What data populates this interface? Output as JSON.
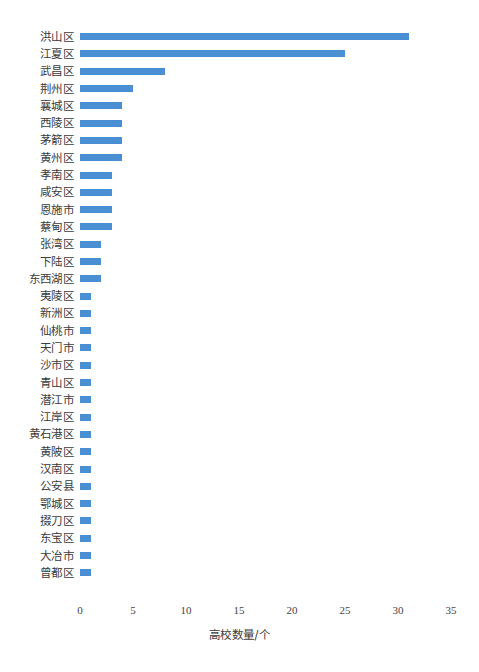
{
  "chart_data": {
    "type": "bar",
    "orientation": "horizontal",
    "title": "",
    "xlabel": "高校数量/个",
    "ylabel": "",
    "xlim": [
      0,
      35
    ],
    "xticks": [
      0,
      5,
      10,
      15,
      20,
      25,
      30,
      35
    ],
    "xtick_labels": [
      "0",
      "5",
      "10",
      "15",
      "20",
      "25",
      "30",
      "35"
    ],
    "grid": false,
    "legend": null,
    "series_color": "#4a8fd4",
    "categories": [
      "洪山区",
      "江夏区",
      "武昌区",
      "荆州区",
      "襄城区",
      "西陵区",
      "茅箭区",
      "黄州区",
      "孝南区",
      "咸安区",
      "恩施市",
      "蔡甸区",
      "张湾区",
      "下陆区",
      "东西湖区",
      "夷陵区",
      "新洲区",
      "仙桃市",
      "天门市",
      "沙市区",
      "青山区",
      "潜江市",
      "江岸区",
      "黄石港区",
      "黄陂区",
      "汉南区",
      "公安县",
      "鄂城区",
      "掇刀区",
      "东宝区",
      "大冶市",
      "曾都区"
    ],
    "values": [
      31,
      25,
      8,
      5,
      4,
      4,
      4,
      4,
      3,
      3,
      3,
      3,
      2,
      2,
      2,
      1,
      1,
      1,
      1,
      1,
      1,
      1,
      1,
      1,
      1,
      1,
      1,
      1,
      1,
      1,
      1,
      1
    ]
  },
  "caption": ""
}
